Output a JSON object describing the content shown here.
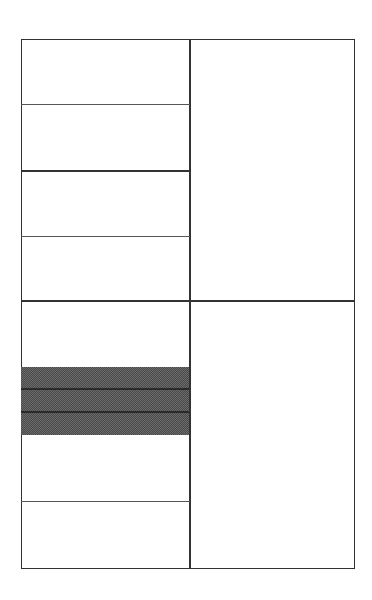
{
  "diagram": {
    "type": "grid-layout",
    "colors": {
      "line": "#333333",
      "background": "#ffffff",
      "shade": "#6a6a6a"
    },
    "frame": {
      "x": 21,
      "y": 39,
      "width": 334,
      "height": 530
    },
    "column_divider_x": 190,
    "row_divider_y": 301,
    "quadrants": [
      {
        "id": "top-left",
        "rows": 4,
        "row_lines_y": [
          104,
          170,
          236
        ]
      },
      {
        "id": "top-right",
        "rows": 1
      },
      {
        "id": "bottom-left",
        "rows": 4,
        "row_lines_y": [
          367,
          435,
          501
        ]
      },
      {
        "id": "bottom-right",
        "rows": 1
      }
    ],
    "shaded_block": {
      "x": 21,
      "y": 367,
      "width": 169,
      "height": 68,
      "bands": 3,
      "band_lines_y": [
        389,
        412
      ]
    },
    "labels": []
  }
}
